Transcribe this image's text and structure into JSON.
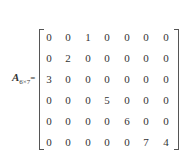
{
  "matrix": {
    "name": "A",
    "subscript": "6×7",
    "equals": "=",
    "rows": [
      [
        "0",
        "0",
        "1",
        "0",
        "0",
        "0",
        "0"
      ],
      [
        "0",
        "2",
        "0",
        "0",
        "0",
        "0",
        "0"
      ],
      [
        "3",
        "0",
        "0",
        "0",
        "0",
        "0",
        "0"
      ],
      [
        "0",
        "0",
        "0",
        "5",
        "0",
        "0",
        "0"
      ],
      [
        "0",
        "0",
        "0",
        "0",
        "6",
        "0",
        "0"
      ],
      [
        "0",
        "0",
        "0",
        "0",
        "0",
        "7",
        "4"
      ]
    ]
  }
}
